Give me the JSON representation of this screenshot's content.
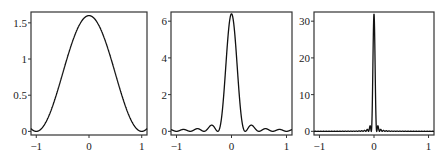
{
  "chart_data": [
    {
      "type": "line",
      "title": "",
      "xlabel": "",
      "ylabel": "",
      "xlim": [
        -1.1,
        1.1
      ],
      "ylim": [
        -0.05,
        1.65
      ],
      "x_ticks": [
        "-1",
        "0",
        "1"
      ],
      "y_ticks": [
        "0",
        "0.5",
        "1",
        "1.5"
      ],
      "y_tick_values": [
        0,
        0.5,
        1,
        1.5
      ],
      "grid": false,
      "series": [
        {
          "name": "kernel n=2",
          "peak": 1.6,
          "n": 2,
          "description": "smooth bump, peak 1.6 at x=0, zeros near +/-0.6, small side lobes ~0.07 near +/-0.9"
        }
      ]
    },
    {
      "type": "line",
      "title": "",
      "xlabel": "",
      "ylabel": "",
      "xlim": [
        -1.1,
        1.1
      ],
      "ylim": [
        -0.2,
        6.5
      ],
      "x_ticks": [
        "-1",
        "0",
        "1"
      ],
      "y_ticks": [
        "0",
        "2",
        "4",
        "6"
      ],
      "y_tick_values": [
        0,
        2,
        4,
        6
      ],
      "grid": false,
      "series": [
        {
          "name": "kernel n=8",
          "peak": 6.4,
          "n": 8,
          "description": "narrow peak 6.4 at x=0, small oscillating side lobes ~0.3"
        }
      ]
    },
    {
      "type": "line",
      "title": "",
      "xlabel": "",
      "ylabel": "",
      "xlim": [
        -1.1,
        1.1
      ],
      "ylim": [
        -1,
        32.5
      ],
      "x_ticks": [
        "-1",
        "0",
        "1"
      ],
      "y_ticks": [
        "0",
        "10",
        "20",
        "30"
      ],
      "y_tick_values": [
        0,
        10,
        20,
        30
      ],
      "grid": false,
      "series": [
        {
          "name": "kernel n=40",
          "peak": 32,
          "n": 40,
          "description": "very sharp spike ~32 at x=0, near-zero elsewhere"
        }
      ]
    }
  ],
  "panels": [
    {
      "x0": 31,
      "x1": 147,
      "y0": 12,
      "y1": 135
    },
    {
      "x0": 171,
      "x1": 292,
      "y0": 12,
      "y1": 135
    },
    {
      "x0": 314,
      "x1": 434,
      "y0": 12,
      "y1": 135
    }
  ]
}
